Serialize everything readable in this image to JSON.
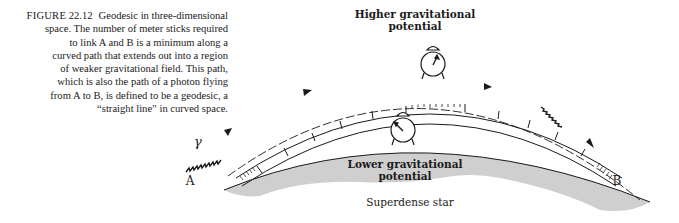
{
  "caption": {
    "figure_label": "FIGURE",
    "figure_number": "22.12",
    "lines": [
      "Geodesic in three-dimensional",
      "space.  The number of meter sticks required",
      "to link A and B is a minimum along a",
      "curved path that extends out into a region",
      "of weaker gravitational field.  This path,",
      "which is also the path of a photon flying",
      "from A to B, is defined to be a geodesic, a",
      "“straight line” in curved space."
    ]
  },
  "diagram": {
    "higher_label_line1": "Higher gravitational",
    "higher_label_line2": "potential",
    "lower_label_line1": "Lower gravitational",
    "lower_label_line2": "potential",
    "star_label": "Superdense star",
    "point_a": "A",
    "point_b": "B",
    "photon_symbol": "γ",
    "colors": {
      "ink": "#1a1a1a",
      "star_fill": "#cfcfcf",
      "background": "#ffffff"
    }
  }
}
